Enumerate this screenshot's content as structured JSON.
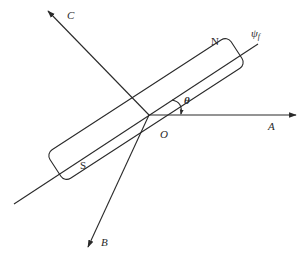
{
  "diagram": {
    "type": "vector-diagram",
    "labels": {
      "north_pole": "N",
      "south_pole": "S",
      "origin": "O",
      "angle": "θ",
      "field_axis": "ψ",
      "field_axis_subscript": "f",
      "vector_a": "A",
      "vector_b": "B",
      "vector_c": "C"
    },
    "colors": {
      "stroke": "#2a2a2a",
      "background": "#ffffff"
    }
  }
}
